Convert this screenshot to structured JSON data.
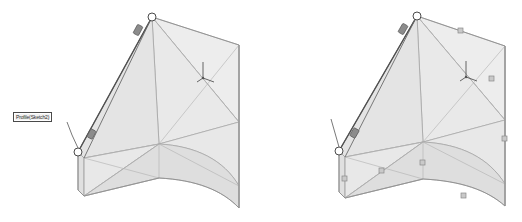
{
  "figure": {
    "background_color": "#ffffff",
    "panel_count": 2
  },
  "style": {
    "face_fill_light": "#f0f0f0",
    "face_fill_mid": "#e6e6e6",
    "face_fill_dark": "#dcdcdc",
    "edge_color": "#9a9a9a",
    "edge_color_dark": "#6e6e6e",
    "highlight_edge_color": "#585858",
    "handle_fill": "#ffffff",
    "handle_stroke": "#4a4a4a",
    "grip_fill": "#8c8c8c",
    "grip_stroke": "#5a5a5a",
    "leader_color": "#555555",
    "triad_color": "#555555",
    "callout_border": "#4a4a4a",
    "callout_background": "#f1f1f1",
    "callout_text_color": "#2b2b2b"
  },
  "panels": [
    {
      "id": "left",
      "name": "loft-viewport-left",
      "callout": {
        "text": "Profile(Sketch2)",
        "name": "profile-sketch2-callout"
      },
      "handles": {
        "vertex_circles": 2,
        "drag_grips": 2,
        "edge_squares": 0
      },
      "triad": {
        "visible": true,
        "label": "origin-triad"
      }
    },
    {
      "id": "right",
      "name": "loft-viewport-right",
      "callout": {
        "text": "Profile(Sketch2)",
        "name": "profile-sketch2-callout"
      },
      "handles": {
        "vertex_circles": 2,
        "drag_grips": 2,
        "edge_squares": 7
      },
      "triad": {
        "visible": true,
        "label": "origin-triad"
      }
    }
  ]
}
